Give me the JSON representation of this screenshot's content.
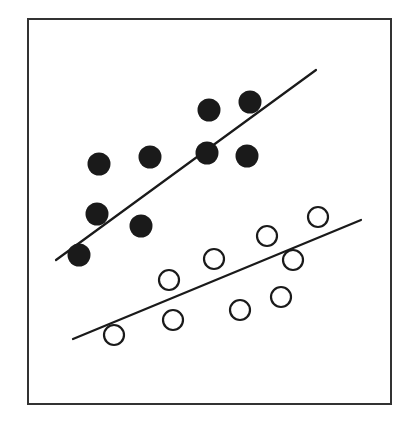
{
  "chart_data": {
    "type": "scatter",
    "title": "",
    "xlabel": "",
    "ylabel": "",
    "axes_visible": false,
    "grid": false,
    "legend": null,
    "frame": {
      "x1": 28,
      "y1": 19,
      "x2": 391,
      "y2": 404,
      "stroke": "#333333",
      "stroke_width": 2
    },
    "series": [
      {
        "name": "filled",
        "marker": "filled-circle",
        "color": "#1a1a1a",
        "radius": 11.5,
        "points": [
          {
            "x": 79,
            "y": 255
          },
          {
            "x": 97,
            "y": 214
          },
          {
            "x": 99,
            "y": 164
          },
          {
            "x": 141,
            "y": 226
          },
          {
            "x": 150,
            "y": 157
          },
          {
            "x": 207,
            "y": 153
          },
          {
            "x": 209,
            "y": 110
          },
          {
            "x": 247,
            "y": 156
          },
          {
            "x": 250,
            "y": 102
          }
        ],
        "fit_line": {
          "x1": 56,
          "y1": 260,
          "x2": 316,
          "y2": 70
        }
      },
      {
        "name": "open",
        "marker": "open-circle",
        "color": "#1a1a1a",
        "radius": 10,
        "points": [
          {
            "x": 114,
            "y": 335
          },
          {
            "x": 169,
            "y": 280
          },
          {
            "x": 173,
            "y": 320
          },
          {
            "x": 214,
            "y": 259
          },
          {
            "x": 240,
            "y": 310
          },
          {
            "x": 267,
            "y": 236
          },
          {
            "x": 281,
            "y": 297
          },
          {
            "x": 293,
            "y": 260
          },
          {
            "x": 318,
            "y": 217
          }
        ],
        "fit_line": {
          "x1": 73,
          "y1": 339,
          "x2": 361,
          "y2": 220
        }
      }
    ]
  }
}
